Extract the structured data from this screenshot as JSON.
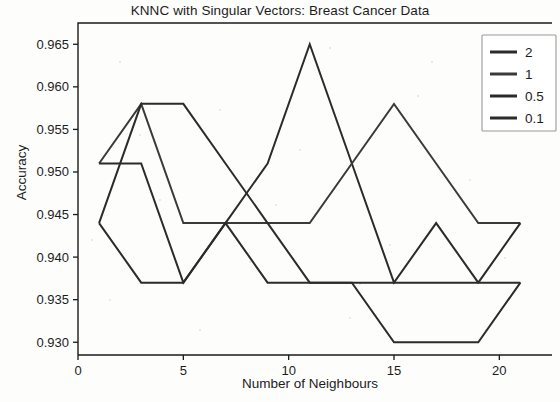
{
  "chart_data": {
    "type": "line",
    "title": "KNNC with Singular Vectors: Breast Cancer Data",
    "xlabel": "Number of Neighbours",
    "ylabel": "Accuracy",
    "x": [
      1,
      3,
      5,
      7,
      9,
      11,
      13,
      15,
      17,
      19,
      21
    ],
    "xlim": [
      0,
      22.5
    ],
    "ylim": [
      0.9285,
      0.9675
    ],
    "xticks": [
      0,
      5,
      10,
      15,
      20
    ],
    "xticklabels": [
      "0",
      "5",
      "10",
      "15",
      "20"
    ],
    "yticks": [
      0.93,
      0.935,
      0.94,
      0.945,
      0.95,
      0.955,
      0.96,
      0.965
    ],
    "yticklabels": [
      "0.930",
      "0.935",
      "0.940",
      "0.945",
      "0.950",
      "0.955",
      "0.960",
      "0.965"
    ],
    "grid": false,
    "legend_position": "upper right",
    "legend_title": "",
    "series": [
      {
        "name": "2",
        "color": "#2b2b2b",
        "values": [
          0.944,
          0.937,
          0.937,
          0.944,
          0.951,
          0.965,
          0.951,
          0.937,
          0.944,
          0.937,
          0.937
        ]
      },
      {
        "name": "1",
        "color": "#3a3a3a",
        "values": [
          0.951,
          0.958,
          0.944,
          0.944,
          0.944,
          0.944,
          0.951,
          0.958,
          0.951,
          0.944,
          0.944
        ]
      },
      {
        "name": "0.5",
        "color": "#2b2b2b",
        "values": [
          0.944,
          0.958,
          0.958,
          0.951,
          0.944,
          0.937,
          0.937,
          0.937,
          0.937,
          0.937,
          0.944
        ]
      },
      {
        "name": "0.1",
        "color": "#2b2b2b",
        "values": [
          0.951,
          0.951,
          0.937,
          0.944,
          0.937,
          0.937,
          0.937,
          0.93,
          0.93,
          0.93,
          0.937
        ]
      }
    ]
  },
  "legend": {
    "items": [
      {
        "label": "2"
      },
      {
        "label": "1"
      },
      {
        "label": "0.5"
      },
      {
        "label": "0.1"
      }
    ]
  }
}
